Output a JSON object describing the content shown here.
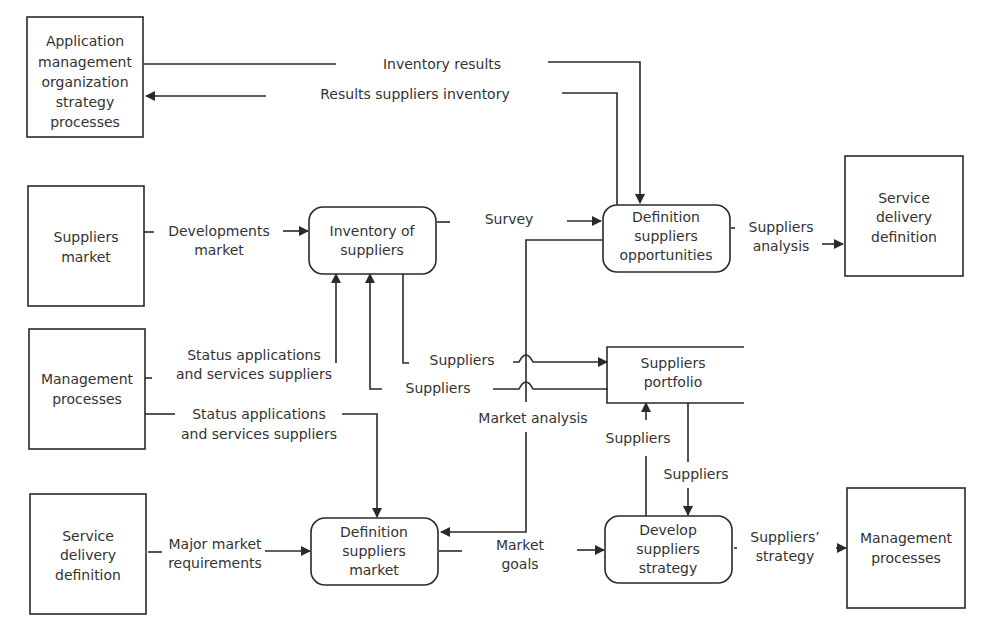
{
  "diagram": {
    "type": "data-flow-diagram",
    "colors": {
      "stroke": "#2a2a2a",
      "text": "#333333",
      "background": "#ffffff"
    },
    "external_entities": [
      {
        "id": "app-mgmt",
        "lines": [
          "Application",
          "management",
          "organization",
          "strategy",
          "processes"
        ]
      },
      {
        "id": "suppliers-market",
        "lines": [
          "Suppliers",
          "market"
        ]
      },
      {
        "id": "mgmt-processes-left",
        "lines": [
          "Management",
          "processes"
        ]
      },
      {
        "id": "service-delivery-left",
        "lines": [
          "Service",
          "delivery",
          "definition"
        ]
      },
      {
        "id": "service-delivery-right",
        "lines": [
          "Service",
          "delivery",
          "definition"
        ]
      },
      {
        "id": "mgmt-processes-right",
        "lines": [
          "Management",
          "processes"
        ]
      }
    ],
    "processes": [
      {
        "id": "inventory",
        "lines": [
          "Inventory of",
          "suppliers"
        ]
      },
      {
        "id": "def-opportunities",
        "lines": [
          "Definition",
          "suppliers",
          "opportunities"
        ]
      },
      {
        "id": "def-market",
        "lines": [
          "Definition",
          "suppliers",
          "market"
        ]
      },
      {
        "id": "develop-strategy",
        "lines": [
          "Develop",
          "suppliers",
          "strategy"
        ]
      }
    ],
    "data_stores": [
      {
        "id": "portfolio",
        "lines": [
          "Suppliers",
          "portfolio"
        ]
      }
    ],
    "flows": [
      {
        "id": "inventory-results",
        "lines": [
          "Inventory results"
        ]
      },
      {
        "id": "results-suppliers-inventory",
        "lines": [
          "Results suppliers inventory"
        ]
      },
      {
        "id": "developments-market",
        "lines": [
          "Developments",
          "market"
        ]
      },
      {
        "id": "survey",
        "lines": [
          "Survey"
        ]
      },
      {
        "id": "suppliers-analysis",
        "lines": [
          "Suppliers",
          "analysis"
        ]
      },
      {
        "id": "status-1",
        "lines": [
          "Status applications",
          "and services suppliers"
        ]
      },
      {
        "id": "status-2",
        "lines": [
          "Status applications",
          "and services suppliers"
        ]
      },
      {
        "id": "suppliers-1",
        "lines": [
          "Suppliers"
        ]
      },
      {
        "id": "suppliers-2",
        "lines": [
          "Suppliers"
        ]
      },
      {
        "id": "market-analysis",
        "lines": [
          "Market analysis"
        ]
      },
      {
        "id": "suppliers-up",
        "lines": [
          "Suppliers"
        ]
      },
      {
        "id": "suppliers-down",
        "lines": [
          "Suppliers"
        ]
      },
      {
        "id": "major-market-req",
        "lines": [
          "Major market",
          "requirements"
        ]
      },
      {
        "id": "market-goals",
        "lines": [
          "Market",
          "goals"
        ]
      },
      {
        "id": "suppliers-strategy",
        "lines": [
          "Suppliers’",
          "strategy"
        ]
      }
    ]
  }
}
